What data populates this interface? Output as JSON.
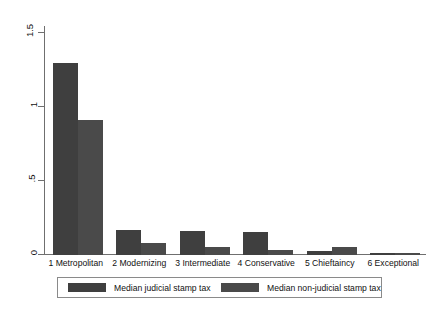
{
  "chart_data": {
    "type": "bar",
    "title": "",
    "subtitle": "",
    "xlabel": "",
    "ylabel": "",
    "grid": false,
    "legend_position": "bottom",
    "categories": [
      "1 Metropolitan",
      "2 Modernizing",
      "3 Intermediate",
      "4 Conservative",
      "5 Chieftaincy",
      "6 Exceptional"
    ],
    "series": [
      {
        "name": "Median judicial stamp tax",
        "color": "#3f3f3f",
        "values": [
          1.3,
          0.17,
          0.165,
          0.155,
          0.03,
          0.015
        ]
      },
      {
        "name": "Median non-judicial stamp tax",
        "color": "#4a4a4a",
        "values": [
          0.91,
          0.08,
          0.055,
          0.035,
          0.055,
          0.012
        ]
      }
    ],
    "ylim": [
      0,
      1.5
    ],
    "yticks": [
      0,
      0.5,
      1,
      1.5
    ],
    "ytick_labels": [
      "0",
      ".5",
      "1",
      "1.5"
    ],
    "axis_color": "#6f6f6f",
    "background_color": "#ffffff"
  },
  "legend": {
    "entries": [
      {
        "label": "Median judicial stamp tax"
      },
      {
        "label": "Median non-judicial stamp tax"
      }
    ]
  }
}
